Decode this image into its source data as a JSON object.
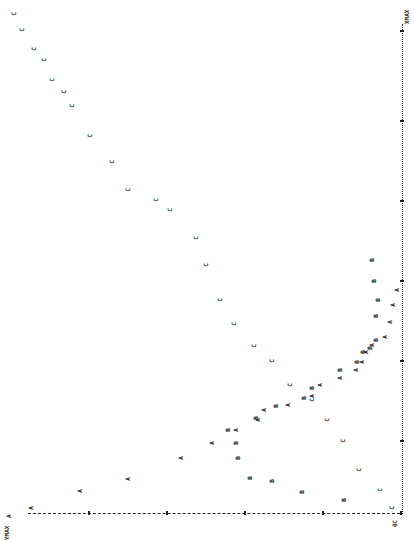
{
  "chart_data": {
    "type": "scatter",
    "title": "",
    "orientation": "rotated 90 degrees counter-clockwise (line-printer plot)",
    "xlabel": "X",
    "ylabel": "Y",
    "labels": {
      "ymax": "YMAX",
      "ymax_marker": "A",
      "origin": "0",
      "xmax": "XMAX"
    },
    "grid": false,
    "legend": null,
    "series": [
      {
        "name": "A",
        "symbol": "A",
        "points_px": [
          [
            31,
            508
          ],
          [
            80,
            491
          ],
          [
            128,
            479
          ],
          [
            181,
            458
          ],
          [
            212,
            443
          ],
          [
            236,
            430
          ],
          [
            258,
            420
          ],
          [
            264,
            410
          ],
          [
            288,
            405
          ],
          [
            312,
            396
          ],
          [
            320,
            385
          ],
          [
            340,
            378
          ],
          [
            356,
            370
          ],
          [
            362,
            362
          ],
          [
            366,
            352
          ],
          [
            372,
            345
          ],
          [
            385,
            337
          ],
          [
            390,
            322
          ],
          [
            393,
            305
          ],
          [
            397,
            290
          ]
        ]
      },
      {
        "name": "B",
        "symbol": "B",
        "points_px": [
          [
            344,
            500
          ],
          [
            302,
            492
          ],
          [
            272,
            481
          ],
          [
            250,
            478
          ],
          [
            238,
            458
          ],
          [
            236,
            443
          ],
          [
            228,
            430
          ],
          [
            256,
            418
          ],
          [
            276,
            406
          ],
          [
            304,
            398
          ],
          [
            312,
            388
          ],
          [
            340,
            370
          ],
          [
            357,
            362
          ],
          [
            363,
            352
          ],
          [
            370,
            348
          ],
          [
            376,
            340
          ],
          [
            376,
            316
          ],
          [
            378,
            300
          ],
          [
            374,
            281
          ],
          [
            372,
            260
          ]
        ]
      },
      {
        "name": "C",
        "symbol": "C",
        "points_px": [
          [
            395,
            522
          ],
          [
            392,
            508
          ],
          [
            380,
            490
          ],
          [
            359,
            470
          ],
          [
            343,
            441
          ],
          [
            327,
            420
          ],
          [
            312,
            400
          ],
          [
            290,
            385
          ],
          [
            272,
            361
          ],
          [
            254,
            346
          ],
          [
            234,
            324
          ],
          [
            220,
            300
          ],
          [
            206,
            265
          ],
          [
            196,
            238
          ],
          [
            170,
            210
          ],
          [
            156,
            200
          ],
          [
            128,
            190
          ],
          [
            112,
            162
          ],
          [
            90,
            136
          ],
          [
            72,
            106
          ],
          [
            64,
            92
          ],
          [
            52,
            80
          ],
          [
            44,
            60
          ],
          [
            34,
            49
          ],
          [
            22,
            30
          ],
          [
            14,
            14
          ]
        ]
      }
    ],
    "y_axis": {
      "position": "bottom edge",
      "from": "YMAX",
      "to": "0",
      "ticks_px": [
        88,
        166,
        244,
        322,
        400
      ]
    },
    "x_axis": {
      "position": "right edge",
      "from": "0",
      "to": "XMAX",
      "ticks_px": [
        30,
        120,
        200,
        280,
        360,
        440
      ]
    }
  }
}
